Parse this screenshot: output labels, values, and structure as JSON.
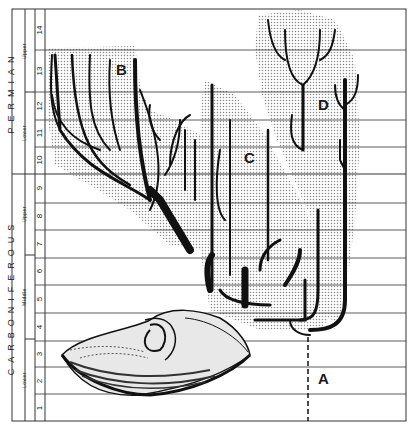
{
  "figure": {
    "periods": [
      {
        "name": "PERMIAN",
        "sub": [
          {
            "name": "Upper",
            "stages": [
              "14",
              "13"
            ]
          },
          {
            "name": "Lower",
            "stages": [
              "12",
              "11",
              "10"
            ]
          }
        ]
      },
      {
        "name": "CARBONIFEROUS",
        "sub": [
          {
            "name": "Upper",
            "stages": [
              "9",
              "8",
              "7"
            ]
          },
          {
            "name": "Middle",
            "stages": [
              "6",
              "5",
              "4"
            ]
          },
          {
            "name": "Lower",
            "stages": [
              "3",
              "2",
              "1"
            ]
          }
        ]
      }
    ],
    "stage_labels": [
      "14",
      "13",
      "12",
      "11",
      "10",
      "9",
      "8",
      "7",
      "6",
      "5",
      "4",
      "3",
      "2",
      "1"
    ],
    "clades": {
      "a": "A",
      "b": "B",
      "c": "C",
      "d": "D"
    },
    "colors": {
      "line": "#333333",
      "lineage": "#111111",
      "stipple": "#b8b8b8",
      "background": "#ffffff"
    }
  }
}
